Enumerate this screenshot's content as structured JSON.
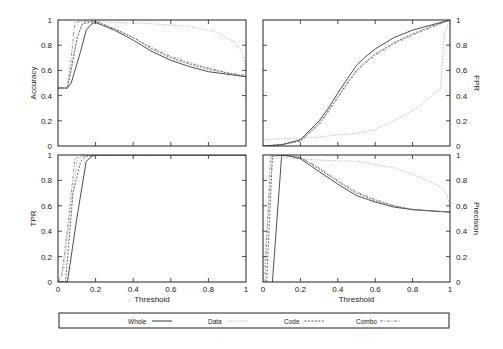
{
  "figure": {
    "legend": {
      "entries": [
        {
          "label": "Whole",
          "color": "#222222",
          "dash": ""
        },
        {
          "label": "Data",
          "color": "#b8b8b8",
          "dash": "1.5,1.5"
        },
        {
          "label": "Code",
          "color": "#444444",
          "dash": "2,1.5"
        },
        {
          "label": "Combo",
          "color": "#777777",
          "dash": "3,1.5,1,1.5"
        }
      ]
    }
  },
  "chart_data": [
    {
      "type": "line",
      "panel": "top-left",
      "title": "",
      "xlabel": "",
      "ylabel": "Accuracy",
      "ylabel_side": "left",
      "xlim": [
        0,
        1
      ],
      "ylim": [
        0,
        1
      ],
      "xticks": [],
      "yticks": [
        "0",
        "0.2",
        "0.4",
        "0.6",
        "0.8",
        "1"
      ],
      "grid": false,
      "series": [
        {
          "name": "Whole",
          "x": [
            0,
            0.05,
            0.07,
            0.12,
            0.15,
            0.18,
            0.2,
            0.3,
            0.4,
            0.5,
            0.6,
            0.7,
            0.8,
            0.9,
            1.0
          ],
          "y": [
            0.46,
            0.46,
            0.5,
            0.75,
            0.92,
            0.97,
            0.98,
            0.92,
            0.84,
            0.75,
            0.68,
            0.63,
            0.59,
            0.57,
            0.55
          ]
        },
        {
          "name": "Data",
          "x": [
            0,
            0.05,
            0.08,
            0.12,
            0.15,
            0.2,
            0.3,
            0.5,
            0.7,
            0.85,
            0.95,
            0.98,
            1.0
          ],
          "y": [
            0.46,
            0.46,
            0.7,
            0.95,
            0.99,
            0.99,
            0.98,
            0.97,
            0.95,
            0.9,
            0.81,
            0.75,
            0.6
          ]
        },
        {
          "name": "Code",
          "x": [
            0,
            0.05,
            0.07,
            0.1,
            0.13,
            0.2,
            0.3,
            0.4,
            0.5,
            0.6,
            0.7,
            0.8,
            0.9,
            1.0
          ],
          "y": [
            0.46,
            0.46,
            0.6,
            0.85,
            0.97,
            0.99,
            0.93,
            0.86,
            0.77,
            0.7,
            0.65,
            0.61,
            0.58,
            0.55
          ]
        },
        {
          "name": "Combo",
          "x": [
            0,
            0.05,
            0.07,
            0.09,
            0.12,
            0.2,
            0.3,
            0.4,
            0.5,
            0.6,
            0.7,
            0.8,
            0.9,
            1.0
          ],
          "y": [
            0.46,
            0.46,
            0.7,
            0.98,
            0.99,
            0.99,
            0.93,
            0.86,
            0.78,
            0.71,
            0.66,
            0.62,
            0.58,
            0.56
          ]
        }
      ]
    },
    {
      "type": "line",
      "panel": "top-right",
      "title": "",
      "xlabel": "",
      "ylabel": "FPR",
      "ylabel_side": "right",
      "xlim": [
        0,
        1
      ],
      "ylim": [
        0,
        1
      ],
      "xticks": [],
      "yticks": [
        "0",
        "0.2",
        "0.4",
        "0.6",
        "0.8",
        "1"
      ],
      "grid": false,
      "series": [
        {
          "name": "Whole",
          "x": [
            0,
            0.1,
            0.2,
            0.3,
            0.35,
            0.4,
            0.45,
            0.5,
            0.55,
            0.6,
            0.7,
            0.8,
            0.9,
            1.0
          ],
          "y": [
            0,
            0.01,
            0.05,
            0.2,
            0.3,
            0.42,
            0.53,
            0.64,
            0.71,
            0.77,
            0.86,
            0.92,
            0.96,
            1.0
          ]
        },
        {
          "name": "Data",
          "x": [
            0,
            0.1,
            0.2,
            0.3,
            0.4,
            0.5,
            0.6,
            0.7,
            0.8,
            0.85,
            0.9,
            0.95,
            0.97,
            1.0
          ],
          "y": [
            0.05,
            0.06,
            0.06,
            0.07,
            0.09,
            0.1,
            0.13,
            0.2,
            0.28,
            0.33,
            0.4,
            0.45,
            0.9,
            1.0
          ]
        },
        {
          "name": "Code",
          "x": [
            0,
            0.1,
            0.2,
            0.3,
            0.35,
            0.4,
            0.45,
            0.5,
            0.55,
            0.6,
            0.7,
            0.8,
            0.9,
            1.0
          ],
          "y": [
            0,
            0.01,
            0.04,
            0.18,
            0.28,
            0.39,
            0.5,
            0.6,
            0.67,
            0.73,
            0.82,
            0.89,
            0.95,
            1.0
          ]
        },
        {
          "name": "Combo",
          "x": [
            0,
            0.1,
            0.2,
            0.3,
            0.35,
            0.4,
            0.45,
            0.5,
            0.55,
            0.6,
            0.7,
            0.8,
            0.9,
            1.0
          ],
          "y": [
            0,
            0.01,
            0.04,
            0.17,
            0.27,
            0.38,
            0.49,
            0.59,
            0.66,
            0.72,
            0.81,
            0.88,
            0.94,
            1.0
          ]
        }
      ]
    },
    {
      "type": "line",
      "panel": "bottom-left",
      "title": "",
      "xlabel": "Threshold",
      "ylabel": "TPR",
      "ylabel_side": "left",
      "xlim": [
        0,
        1
      ],
      "ylim": [
        0,
        1
      ],
      "xticks": [
        "0",
        "0.2",
        "0.4",
        "0.6",
        "0.8",
        "1"
      ],
      "yticks": [
        "0",
        "0.2",
        "0.4",
        "0.6",
        "0.8",
        "1"
      ],
      "grid": false,
      "series": [
        {
          "name": "Whole",
          "x": [
            0,
            0.05,
            0.1,
            0.15,
            0.18,
            0.2,
            1.0
          ],
          "y": [
            0,
            0,
            0.5,
            0.95,
            0.99,
            1.0,
            1.0
          ]
        },
        {
          "name": "Data",
          "x": [
            0,
            0.03,
            0.07,
            0.1,
            0.13,
            0.2,
            1.0
          ],
          "y": [
            0,
            0.1,
            0.6,
            0.95,
            0.99,
            1.0,
            1.0
          ]
        },
        {
          "name": "Code",
          "x": [
            0,
            0.04,
            0.08,
            0.12,
            0.15,
            0.2,
            1.0
          ],
          "y": [
            0,
            0,
            0.7,
            0.95,
            0.99,
            1.0,
            1.0
          ]
        },
        {
          "name": "Combo",
          "x": [
            0,
            0.02,
            0.06,
            0.09,
            0.12,
            0.2,
            1.0
          ],
          "y": [
            0,
            0.05,
            0.55,
            0.97,
            0.99,
            1.0,
            1.0
          ]
        }
      ]
    },
    {
      "type": "line",
      "panel": "bottom-right",
      "title": "",
      "xlabel": "Threshold",
      "ylabel": "Precision",
      "ylabel_side": "right",
      "xlim": [
        0,
        1
      ],
      "ylim": [
        0,
        1
      ],
      "xticks": [
        "0",
        "0.2",
        "0.4",
        "0.6",
        "0.8",
        "1"
      ],
      "yticks": [
        "0",
        "0.2",
        "0.4",
        "0.6",
        "0.8",
        "1"
      ],
      "grid": false,
      "series": [
        {
          "name": "Whole",
          "x": [
            0.05,
            0.1,
            0.15,
            0.2,
            0.3,
            0.4,
            0.5,
            0.6,
            0.7,
            0.8,
            0.9,
            1.0
          ],
          "y": [
            0,
            1.0,
            0.99,
            0.97,
            0.87,
            0.77,
            0.68,
            0.63,
            0.59,
            0.57,
            0.56,
            0.55
          ]
        },
        {
          "name": "Data",
          "x": [
            0.0,
            0.05,
            0.1,
            0.2,
            0.3,
            0.5,
            0.7,
            0.85,
            0.95,
            0.98,
            1.0
          ],
          "y": [
            0,
            0.97,
            0.98,
            0.97,
            0.96,
            0.95,
            0.9,
            0.82,
            0.75,
            0.7,
            0.6
          ]
        },
        {
          "name": "Code",
          "x": [
            0.02,
            0.05,
            0.1,
            0.2,
            0.3,
            0.4,
            0.5,
            0.6,
            0.7,
            0.8,
            0.9,
            1.0
          ],
          "y": [
            0,
            0.99,
            1.0,
            0.98,
            0.89,
            0.79,
            0.7,
            0.64,
            0.6,
            0.57,
            0.56,
            0.55
          ]
        },
        {
          "name": "Combo",
          "x": [
            0.01,
            0.04,
            0.1,
            0.2,
            0.3,
            0.4,
            0.5,
            0.6,
            0.7,
            0.8,
            0.9,
            1.0
          ],
          "y": [
            0,
            0.99,
            1.0,
            0.98,
            0.9,
            0.8,
            0.71,
            0.65,
            0.6,
            0.57,
            0.56,
            0.55
          ]
        }
      ]
    }
  ]
}
